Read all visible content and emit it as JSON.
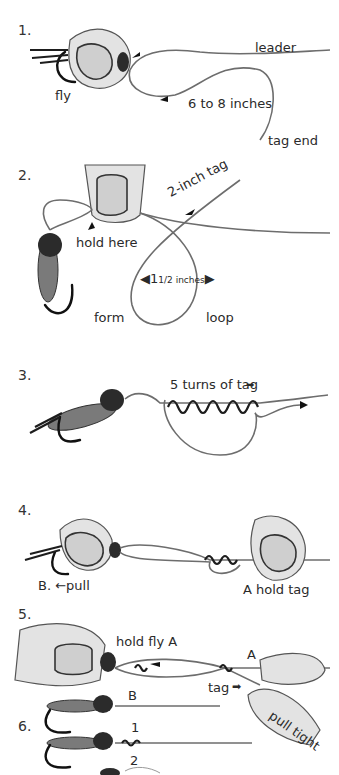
{
  "steps": [
    {
      "number": "1.",
      "labels": {
        "fly": "fly",
        "leader": "leader",
        "length": "6 to 8 inches",
        "tag_end": "tag end"
      }
    },
    {
      "number": "2.",
      "labels": {
        "hold": "hold here",
        "tag": "2-inch tag",
        "size_whole": "1",
        "size_frac": "1/2 inches",
        "form": "form",
        "loop": "loop"
      }
    },
    {
      "number": "3.",
      "labels": {
        "turns": "5 turns of tag"
      }
    },
    {
      "number": "4.",
      "labels": {
        "pull": "B. ←pull",
        "hold_tag": "A hold tag"
      }
    },
    {
      "number": "5.",
      "labels": {
        "hold_fly": "hold fly A",
        "a": "A",
        "tag": "tag",
        "b": "B",
        "pull_tight": "pull tight"
      }
    },
    {
      "number": "6.",
      "labels": {
        "one": "1",
        "two": "2"
      }
    }
  ],
  "colors": {
    "line": "#6d6d6d",
    "ink": "#1d1d1d",
    "skin": "#e3e3e3"
  }
}
